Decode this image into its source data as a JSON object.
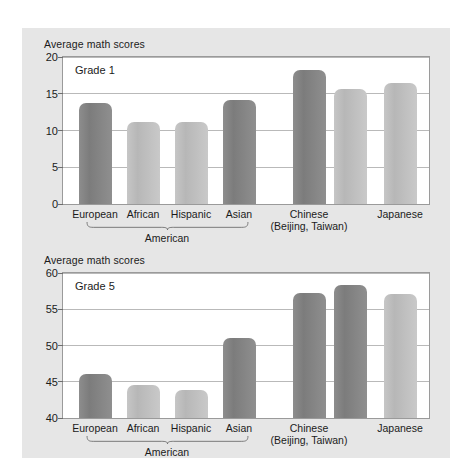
{
  "figure": {
    "background_color": "#e6e6e6",
    "page_background": "#ffffff"
  },
  "colors": {
    "bar_dark": "#828282",
    "bar_light": "#c0c0c0",
    "grid": "#b9b9b9",
    "axis": "#9a9a9a",
    "text": "#1b1b1b"
  },
  "panels": [
    {
      "id": "grade1",
      "axis_title": "Average math scores",
      "panel_label": "Grade 1",
      "yticks": [
        "0",
        "5",
        "10",
        "15",
        "20"
      ],
      "group_brace_label": "American",
      "bars": [
        {
          "label": "European",
          "sublabel": "",
          "value": 13.8,
          "shade": "dark"
        },
        {
          "label": "African",
          "sublabel": "",
          "value": 11.1,
          "shade": "light"
        },
        {
          "label": "Hispanic",
          "sublabel": "",
          "value": 11.2,
          "shade": "light"
        },
        {
          "label": "Asian",
          "sublabel": "",
          "value": 14.2,
          "shade": "dark"
        },
        {
          "label": "Chinese",
          "sublabel": "(Beijing, Taiwan)",
          "value": 18.3,
          "shade": "dark"
        },
        {
          "label": "",
          "sublabel": "",
          "value": 15.7,
          "shade": "light"
        },
        {
          "label": "Japanese",
          "sublabel": "",
          "value": 16.4,
          "shade": "light"
        }
      ]
    },
    {
      "id": "grade5",
      "axis_title": "Average math scores",
      "panel_label": "Grade 5",
      "yticks": [
        "40",
        "45",
        "50",
        "55",
        "60"
      ],
      "group_brace_label": "American",
      "bars": [
        {
          "label": "European",
          "sublabel": "",
          "value": 46.1,
          "shade": "dark"
        },
        {
          "label": "African",
          "sublabel": "",
          "value": 44.6,
          "shade": "light"
        },
        {
          "label": "Hispanic",
          "sublabel": "",
          "value": 43.8,
          "shade": "light"
        },
        {
          "label": "Asian",
          "sublabel": "",
          "value": 51.0,
          "shade": "dark"
        },
        {
          "label": "Chinese",
          "sublabel": "(Beijing, Taiwan)",
          "value": 57.2,
          "shade": "dark"
        },
        {
          "label": "",
          "sublabel": "",
          "value": 58.4,
          "shade": "dark"
        },
        {
          "label": "Japanese",
          "sublabel": "",
          "value": 57.1,
          "shade": "light"
        }
      ]
    }
  ],
  "chart_data": [
    {
      "type": "bar",
      "title": "Grade 1",
      "ylabel": "Average math scores",
      "xlabel": "",
      "ylim": [
        0,
        20
      ],
      "yticks": [
        0,
        5,
        10,
        15,
        20
      ],
      "grid": true,
      "legend": "none",
      "categories": [
        "European American",
        "African American",
        "Hispanic American",
        "Asian American",
        "Chinese (Beijing)",
        "Chinese (Taiwan)",
        "Japanese"
      ],
      "values": [
        13.8,
        11.1,
        11.2,
        14.2,
        18.3,
        15.7,
        16.4
      ],
      "annotations": [
        "American (bracket spans first four categories)"
      ]
    },
    {
      "type": "bar",
      "title": "Grade 5",
      "ylabel": "Average math scores",
      "xlabel": "",
      "ylim": [
        40,
        60
      ],
      "yticks": [
        40,
        45,
        50,
        55,
        60
      ],
      "grid": true,
      "legend": "none",
      "categories": [
        "European American",
        "African American",
        "Hispanic American",
        "Asian American",
        "Chinese (Beijing)",
        "Chinese (Taiwan)",
        "Japanese"
      ],
      "values": [
        46.1,
        44.6,
        43.8,
        51.0,
        57.2,
        58.4,
        57.1
      ],
      "annotations": [
        "American (bracket spans first four categories)"
      ]
    }
  ]
}
